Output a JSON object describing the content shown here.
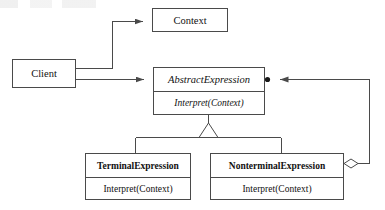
{
  "diagram": {
    "type": "uml-class-diagram",
    "classes": [
      {
        "id": "context",
        "name": "Context",
        "style": "plain",
        "operations": []
      },
      {
        "id": "client",
        "name": "Client",
        "style": "plain",
        "operations": []
      },
      {
        "id": "abstract-expression",
        "name": "AbstractExpression",
        "style": "italic",
        "operations": [
          "Interpret(Context)"
        ]
      },
      {
        "id": "terminal-expression",
        "name": "TerminalExpression",
        "style": "bold",
        "operations": [
          "Interpret(Context)"
        ]
      },
      {
        "id": "nonterminal-expression",
        "name": "NonterminalExpression",
        "style": "bold",
        "operations": [
          "Interpret(Context)"
        ]
      }
    ],
    "relationships": [
      {
        "id": "client-to-context",
        "from": "client",
        "to": "context",
        "kind": "association-arrow"
      },
      {
        "id": "client-to-abstract",
        "from": "client",
        "to": "abstract-expression",
        "kind": "association-arrow"
      },
      {
        "id": "terminal-inherits",
        "from": "terminal-expression",
        "to": "abstract-expression",
        "kind": "generalization"
      },
      {
        "id": "nonterminal-inherits",
        "from": "nonterminal-expression",
        "to": "abstract-expression",
        "kind": "generalization"
      },
      {
        "id": "nonterminal-aggregates-abstract",
        "from": "nonterminal-expression",
        "to": "abstract-expression",
        "kind": "aggregation-arrow"
      }
    ],
    "colors": {
      "line": "#4a4a4a",
      "text": "#111111",
      "background": "#ffffff"
    }
  }
}
